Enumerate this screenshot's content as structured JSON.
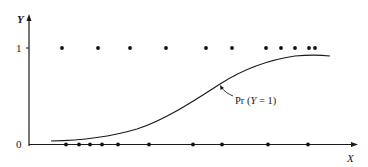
{
  "chart_data": {
    "type": "scatter",
    "title": "",
    "xlabel": "X",
    "ylabel": "Y",
    "y_ticks": [
      "0",
      "1"
    ],
    "grid": false,
    "legend": null,
    "annotation": "Pr (Y = 1)",
    "series": [
      {
        "name": "Y = 1 observations",
        "kind": "points",
        "y": 1,
        "x": [
          62,
          98,
          130,
          166,
          206,
          232,
          266,
          281,
          295,
          309,
          315
        ]
      },
      {
        "name": "Y = 0 observations",
        "kind": "points",
        "y": 0,
        "x": [
          66,
          79,
          90,
          102,
          118,
          149,
          193,
          222,
          268,
          308
        ]
      },
      {
        "name": "Pr (Y = 1)",
        "kind": "logistic curve",
        "x": [
          43,
          90,
          137,
          180,
          220,
          260,
          300,
          330
        ],
        "y": [
          0.03,
          0.06,
          0.23,
          0.44,
          0.64,
          0.82,
          0.92,
          0.92
        ]
      }
    ],
    "xlim": [
      29,
      356
    ],
    "ylim": [
      0,
      1.3
    ]
  },
  "labels": {
    "y_axis": "Y",
    "x_axis": "X",
    "tick_one": "1",
    "tick_zero": "0",
    "curve_label": "Pr (",
    "curve_label_y": "Y",
    "curve_label_tail": " = 1)"
  }
}
